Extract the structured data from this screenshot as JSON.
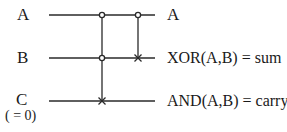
{
  "diagram": {
    "type": "reversible-circuit",
    "title": "",
    "inputs": [
      {
        "label": "A",
        "note": ""
      },
      {
        "label": "B",
        "note": ""
      },
      {
        "label": "C",
        "note": "( = 0)"
      }
    ],
    "outputs": [
      {
        "label": "A"
      },
      {
        "label": "XOR(A,B) = sum"
      },
      {
        "label": "AND(A,B) = carry"
      }
    ],
    "gates": [
      {
        "type": "toffoli",
        "controls": [
          "A",
          "B"
        ],
        "target": "C"
      },
      {
        "type": "cnot",
        "controls": [
          "A"
        ],
        "target": "B"
      }
    ],
    "colors": {
      "line": "#2a2a2a",
      "text": "#1a1a1a",
      "background": "#ffffff"
    }
  }
}
